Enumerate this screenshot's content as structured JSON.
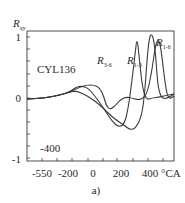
{
  "chart_data": {
    "type": "line",
    "title": "",
    "annotation_label": "CYL136",
    "annotation_extra": "-400",
    "subfigure_label": "a)",
    "ylabel": "R",
    "ylabel_sub": "xy",
    "xlabel": "°CA",
    "ylim": [
      -1,
      1
    ],
    "xlim": [
      -720,
      720
    ],
    "yticks": [
      "1",
      "0",
      "-1"
    ],
    "xticks": [
      "-550",
      "-200",
      "0",
      "200",
      "400"
    ],
    "grid": false,
    "legend_position": "inline-labels",
    "series": [
      {
        "name": "R3-6",
        "label_main": "R",
        "label_sub": "3-6",
        "points_px": [
          [
            27,
            99
          ],
          [
            45,
            98
          ],
          [
            60,
            95
          ],
          [
            70,
            92
          ],
          [
            76,
            87
          ],
          [
            82,
            86
          ],
          [
            88,
            88
          ],
          [
            94,
            95
          ],
          [
            100,
            103
          ],
          [
            106,
            112
          ],
          [
            112,
            121
          ],
          [
            118,
            127
          ],
          [
            124,
            125
          ],
          [
            128,
            110
          ],
          [
            132,
            80
          ],
          [
            135,
            55
          ],
          [
            137,
            37
          ],
          [
            139,
            55
          ],
          [
            142,
            85
          ],
          [
            146,
            100
          ],
          [
            152,
            98
          ],
          [
            160,
            97
          ],
          [
            168,
            95
          ],
          [
            174,
            94
          ]
        ]
      },
      {
        "name": "R1-3",
        "label_main": "R",
        "label_sub": "1-3",
        "points_px": [
          [
            27,
            99
          ],
          [
            45,
            98
          ],
          [
            60,
            95
          ],
          [
            70,
            92
          ],
          [
            76,
            91
          ],
          [
            84,
            94
          ],
          [
            92,
            99
          ],
          [
            100,
            105
          ],
          [
            108,
            113
          ],
          [
            116,
            120
          ],
          [
            124,
            125
          ],
          [
            130,
            130
          ],
          [
            136,
            128
          ],
          [
            142,
            115
          ],
          [
            145,
            90
          ],
          [
            147,
            60
          ],
          [
            149,
            40
          ],
          [
            151,
            33
          ],
          [
            154,
            40
          ],
          [
            156,
            60
          ],
          [
            158,
            88
          ],
          [
            162,
            99
          ],
          [
            168,
            98
          ],
          [
            174,
            94
          ]
        ]
      },
      {
        "name": "R1-6",
        "label_main": "R",
        "label_sub": "1-6",
        "points_px": [
          [
            27,
            99
          ],
          [
            45,
            98
          ],
          [
            60,
            95
          ],
          [
            70,
            92
          ],
          [
            78,
            88
          ],
          [
            86,
            85
          ],
          [
            94,
            85
          ],
          [
            100,
            88
          ],
          [
            104,
            97
          ],
          [
            106,
            105
          ],
          [
            110,
            110
          ],
          [
            116,
            105
          ],
          [
            120,
            100
          ],
          [
            126,
            97
          ],
          [
            132,
            98
          ],
          [
            138,
            100
          ],
          [
            144,
            98
          ],
          [
            148,
            90
          ],
          [
            152,
            70
          ],
          [
            155,
            48
          ],
          [
            158,
            38
          ],
          [
            161,
            48
          ],
          [
            164,
            75
          ],
          [
            167,
            95
          ],
          [
            170,
            99
          ],
          [
            174,
            96
          ]
        ]
      }
    ],
    "approx_peaks": [
      {
        "series": "R3-6",
        "x_deg": 160,
        "y": 1.0
      },
      {
        "series": "R1-3",
        "x_deg": 270,
        "y": 1.0
      },
      {
        "series": "R1-6",
        "x_deg": 380,
        "y": 1.0
      }
    ],
    "approx_troughs": [
      {
        "series": "R3-6",
        "x_deg": 200,
        "y": -0.45
      },
      {
        "series": "R1-3",
        "x_deg": 260,
        "y": -0.5
      },
      {
        "series": "R1-6",
        "x_deg": 60,
        "y": -0.2
      }
    ]
  },
  "frame": {
    "left": 27,
    "top": 31,
    "right": 174,
    "bottom": 161
  },
  "axis_px": {
    "y1": 37,
    "y0": 98,
    "ym1": 158,
    "xtick_px": [
      42,
      57,
      72,
      88,
      103,
      117,
      133,
      148,
      163
    ],
    "xlabel_px": [
      42,
      67,
      93,
      122,
      152
    ],
    "ytick_px": [
      37,
      49,
      61,
      74,
      86,
      98,
      110,
      122,
      134,
      146,
      158
    ]
  },
  "colors": {
    "line": "#3a3a3a",
    "text": "#2a2a2a",
    "background": "#ffffff"
  }
}
